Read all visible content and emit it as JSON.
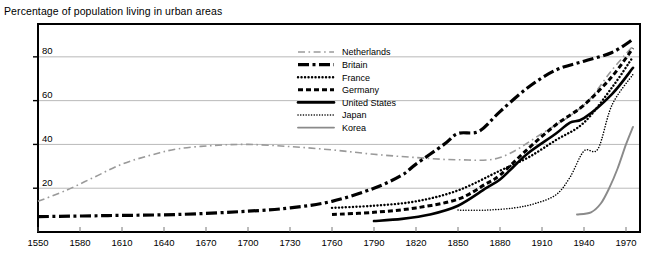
{
  "chart_title": "Percentage of population living in urban areas",
  "chart_data": {
    "type": "line",
    "title": "Percentage of population living in urban areas",
    "xlabel": "",
    "ylabel": "",
    "xlim": [
      1550,
      1980
    ],
    "ylim": [
      0,
      95
    ],
    "grid": true,
    "legend_position": "top-center",
    "xticks": [
      "1550",
      "1580",
      "1610",
      "1640",
      "1670",
      "1700",
      "1730",
      "1760",
      "1790",
      "1820",
      "1850",
      "1880",
      "1910",
      "1940",
      "1970"
    ],
    "yticks": [
      "20",
      "40",
      "60",
      "80"
    ],
    "series": [
      {
        "name": "Netherlands",
        "style": "long-dash-light",
        "color": "#9a9a9a",
        "x": [
          1550,
          1570,
          1590,
          1610,
          1630,
          1650,
          1675,
          1700,
          1730,
          1760,
          1790,
          1820,
          1850,
          1880,
          1910,
          1940,
          1960,
          1975
        ],
        "y": [
          14,
          19,
          25,
          31,
          35,
          38,
          39.5,
          40,
          39,
          37.5,
          35.5,
          34,
          33,
          34,
          45,
          58,
          74,
          85
        ]
      },
      {
        "name": "Britain",
        "style": "dash-dot-heavy",
        "color": "#000000",
        "x": [
          1550,
          1600,
          1650,
          1700,
          1730,
          1760,
          1790,
          1810,
          1820,
          1840,
          1850,
          1865,
          1880,
          1900,
          1920,
          1940,
          1960,
          1975
        ],
        "y": [
          7,
          7.5,
          8,
          9.5,
          11,
          14,
          20,
          26,
          31,
          40,
          45,
          46,
          55,
          66,
          74,
          78,
          82,
          88
        ]
      },
      {
        "name": "France",
        "style": "fine-dot",
        "color": "#000000",
        "x": [
          1760,
          1790,
          1820,
          1850,
          1880,
          1900,
          1920,
          1940,
          1960,
          1975
        ],
        "y": [
          11,
          12,
          14,
          19,
          28,
          34,
          42,
          50,
          66,
          80
        ]
      },
      {
        "name": "Germany",
        "style": "short-dash",
        "color": "#000000",
        "x": [
          1760,
          1790,
          1820,
          1850,
          1870,
          1880,
          1900,
          1920,
          1940,
          1960,
          1975
        ],
        "y": [
          8,
          9,
          11,
          15,
          22,
          26,
          38,
          49,
          58,
          71,
          84
        ]
      },
      {
        "name": "United States",
        "style": "solid-heavy",
        "color": "#000000",
        "x": [
          1790,
          1810,
          1830,
          1850,
          1870,
          1880,
          1890,
          1900,
          1920,
          1930,
          1940,
          1960,
          1975
        ],
        "y": [
          5,
          6,
          8,
          12,
          20,
          24,
          30,
          36,
          45,
          50,
          52,
          63,
          75
        ]
      },
      {
        "name": "Japan",
        "style": "dotted-light",
        "color": "#000000",
        "x": [
          1850,
          1870,
          1890,
          1905,
          1920,
          1930,
          1940,
          1950,
          1960,
          1975
        ],
        "y": [
          10,
          10,
          11,
          13,
          17,
          25,
          37,
          38,
          58,
          72
        ]
      },
      {
        "name": "Korea",
        "style": "solid-gray",
        "color": "#8a8a8a",
        "x": [
          1935,
          1945,
          1952,
          1958,
          1964,
          1970,
          1975
        ],
        "y": [
          8,
          9,
          13,
          20,
          29,
          40,
          48
        ]
      }
    ]
  },
  "legend": {
    "items": [
      {
        "label": "Netherlands"
      },
      {
        "label": "Britain"
      },
      {
        "label": "France"
      },
      {
        "label": "Germany"
      },
      {
        "label": "United States"
      },
      {
        "label": "Japan"
      },
      {
        "label": "Korea"
      }
    ]
  }
}
